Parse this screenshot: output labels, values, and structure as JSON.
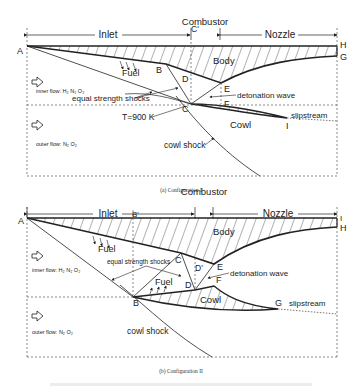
{
  "config1": {
    "sections": {
      "inlet": "Inlet",
      "combustor": "Combustor",
      "nozzle": "Nozzle"
    },
    "points": {
      "A": "A",
      "B": "B",
      "C": "C",
      "C_prime": "C'",
      "D": "D",
      "E": "E",
      "F": "F",
      "G": "G",
      "H": "H",
      "I": "I"
    },
    "labels": {
      "fuel": "Fuel",
      "body": "Body",
      "cowl": "Cowl",
      "inner_flow": "inner flow: H₂ N₂ O₂",
      "outer_flow": "outer flow: N₂ O₂",
      "equal_strength_shocks": "equal strength shocks",
      "temperature": "T=900 K",
      "detonation_wave": "detonation wave",
      "slipstream": "slipstream",
      "cowl_shock": "cowl shock"
    },
    "caption": "(a) Configuration I"
  },
  "config2": {
    "sections": {
      "inlet": "Inlet",
      "combustor": "Combustor",
      "nozzle": "Nozzle"
    },
    "points": {
      "A": "A",
      "B": "B",
      "B_prime": "B'",
      "C": "C",
      "D": "D",
      "D_prime": "D'",
      "E": "E",
      "F": "F",
      "G": "G",
      "H": "H",
      "I": "I"
    },
    "labels": {
      "fuel_top": "Fuel",
      "fuel_cowl": "Fuel",
      "body": "Body",
      "cowl": "Cowl",
      "inner_flow": "inner flow: H₂ N₂ O₂",
      "outer_flow": "outer flow: N₂ O₂",
      "equal_strength_shocks": "equal strength shocks",
      "detonation_wave": "detonation wave",
      "slipstream": "slipstream",
      "cowl_shock": "cowl shock"
    },
    "caption": "(b) Configuration II"
  },
  "colors": {
    "line": "#222222",
    "dashed": "#555555",
    "background": "#ffffff"
  }
}
